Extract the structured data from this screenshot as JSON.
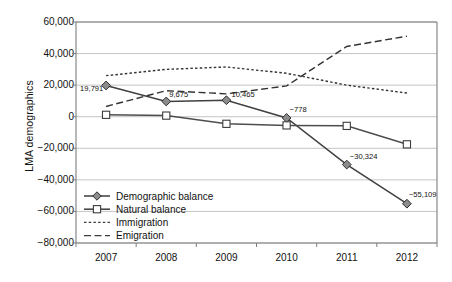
{
  "chart_data": {
    "type": "line",
    "title": "",
    "xlabel": "",
    "ylabel": "LMA demographics",
    "categories": [
      "2007",
      "2008",
      "2009",
      "2010",
      "2011",
      "2012"
    ],
    "ylim": [
      -80000,
      60000
    ],
    "ytick_values": [
      60000,
      40000,
      20000,
      0,
      -20000,
      -40000,
      -60000,
      -80000
    ],
    "ytick_labels": [
      "60,000",
      "40,000",
      "20,000",
      "0",
      "−20,000",
      "−40,000",
      "−60,000",
      "−80,000"
    ],
    "grid": true,
    "legend_position": "inside-bottom-left",
    "series": [
      {
        "name": "Demographic balance",
        "marker": "diamond",
        "line_style": "solid",
        "color": "#404040",
        "values": [
          19791,
          9675,
          10465,
          -778,
          -30324,
          -55109
        ],
        "data_labels": [
          "19,791",
          "9,675",
          "10,465",
          "−778",
          "−30,324",
          "−55,109"
        ]
      },
      {
        "name": "Natural balance",
        "marker": "square",
        "line_style": "solid",
        "color": "#4d4d4d",
        "values": [
          1200,
          700,
          -4500,
          -5500,
          -5800,
          -17500
        ],
        "data_labels": [
          "",
          "",
          "",
          "",
          "",
          ""
        ]
      },
      {
        "name": "Immigration",
        "marker": "none",
        "line_style": "dotted",
        "color": "#333333",
        "values": [
          26000,
          30000,
          31500,
          27500,
          20000,
          15000
        ],
        "data_labels": [
          "",
          "",
          "",
          "",
          "",
          ""
        ]
      },
      {
        "name": "Emigration",
        "marker": "none",
        "line_style": "dashed",
        "color": "#333333",
        "values": [
          6500,
          16500,
          14500,
          19500,
          44500,
          51000
        ],
        "data_labels": [
          "",
          "",
          "",
          "",
          "",
          ""
        ]
      }
    ],
    "legend_entries": [
      {
        "label": "Demographic balance",
        "marker": "diamond",
        "line_style": "solid"
      },
      {
        "label": "Natural balance",
        "marker": "square",
        "line_style": "solid"
      },
      {
        "label": "Immigration",
        "marker": "none",
        "line_style": "dotted"
      },
      {
        "label": "Emigration",
        "marker": "none",
        "line_style": "dashed"
      }
    ],
    "colors": {
      "axis": "#7d7d7d",
      "grid": "#b5b5b5",
      "text": "#111111",
      "marker_fill": "#8c8c8c",
      "series_line": "#3d3d3d"
    }
  }
}
